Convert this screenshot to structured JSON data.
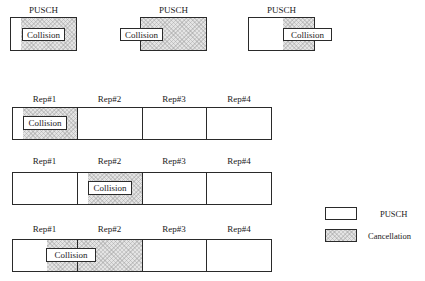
{
  "top_examples": [
    {
      "title": "PUSCH",
      "collision": "Collision"
    },
    {
      "title": "PUSCH",
      "collision": "Collision"
    },
    {
      "title": "PUSCH",
      "collision": "Collision"
    }
  ],
  "rows": [
    {
      "reps": [
        "Rep#1",
        "Rep#2",
        "Rep#3",
        "Rep#4"
      ],
      "collision": "Collision"
    },
    {
      "reps": [
        "Rep#1",
        "Rep#2",
        "Rep#3",
        "Rep#4"
      ],
      "collision": "Collision"
    },
    {
      "reps": [
        "Rep#1",
        "Rep#2",
        "Rep#3",
        "Rep#4"
      ],
      "collision": "Collision"
    }
  ],
  "legend": {
    "pusch": "PUSCH",
    "cancellation": "Cancellation"
  },
  "colors": {
    "border": "#2a2a2a",
    "cancellation_fill": "#e4e4e4",
    "background": "#ffffff"
  }
}
